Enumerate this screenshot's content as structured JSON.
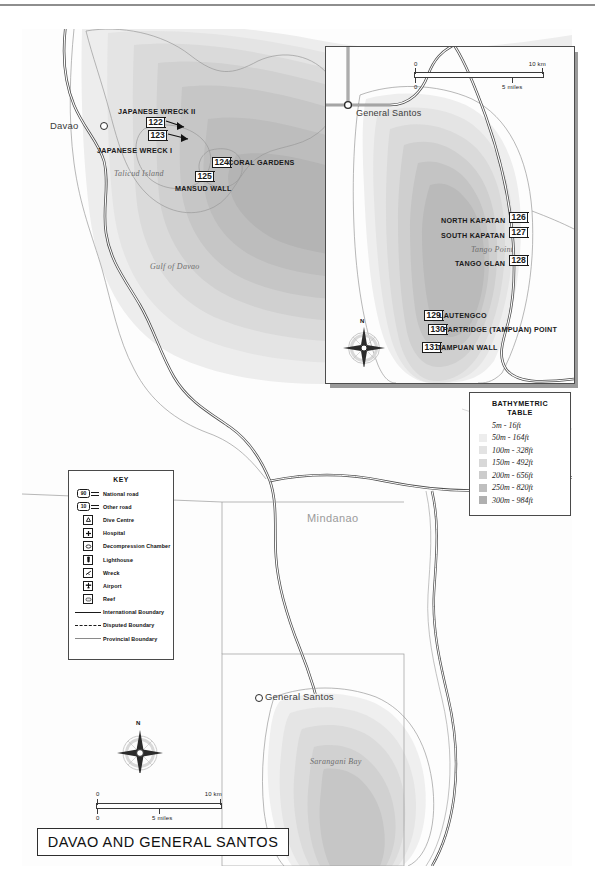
{
  "map": {
    "title": "DAVAO AND GENERAL SANTOS",
    "places": [
      {
        "name": "Davao",
        "x": 52,
        "y": 96
      },
      {
        "name": "General Santos",
        "x": 265,
        "y": 698
      }
    ],
    "water_labels": [
      {
        "name": "Gulf of Davao",
        "x": 148,
        "y": 265
      },
      {
        "name": "Sarangani Bay",
        "x": 310,
        "y": 762
      },
      {
        "name": "Talicud Island",
        "x": 114,
        "y": 173
      }
    ],
    "region_label": "Mindanao",
    "dive_sites": [
      {
        "num": "122",
        "name": "JAPANESE WRECK II",
        "name_x": 118,
        "name_y": 110,
        "mk_x": 146,
        "mk_y": 119
      },
      {
        "num": "123",
        "name": "JAPANESE WRECK I",
        "name_x": 97,
        "name_y": 149,
        "mk_x": 148,
        "mk_y": 131
      },
      {
        "num": "124",
        "name": "CORAL GARDENS",
        "name_x": 228,
        "name_y": 161,
        "mk_x": 212,
        "mk_y": 158
      },
      {
        "num": "125",
        "name": "MANSUD WALL",
        "name_x": 175,
        "name_y": 186,
        "mk_x": 195,
        "mk_y": 172
      }
    ]
  },
  "inset": {
    "place": "General Santos",
    "point_label": "Tango Point",
    "dive_sites": [
      {
        "num": "126",
        "name": "NORTH KAPATAN",
        "side": "left"
      },
      {
        "num": "127",
        "name": "SOUTH KAPATAN",
        "side": "left"
      },
      {
        "num": "128",
        "name": "TANGO GLAN",
        "side": "left"
      },
      {
        "num": "129",
        "name": "LAUTENGCO",
        "side": "right"
      },
      {
        "num": "130",
        "name": "PARTRIDGE (TAMPUAN) POINT",
        "side": "right"
      },
      {
        "num": "131",
        "name": "TAMPUAN WALL",
        "side": "right"
      }
    ],
    "scale": {
      "km_zero": "0",
      "km_max": "10 km",
      "mi_zero": "0",
      "mi_mid": "5 miles"
    },
    "compass_n": "N"
  },
  "bathymetric": {
    "title_line1": "BATHYMETRIC",
    "title_line2": "TABLE",
    "rows": [
      {
        "label": "5m - 16ft",
        "color": "#ffffff"
      },
      {
        "label": "50m - 164ft",
        "color": "#ededed"
      },
      {
        "label": "100m - 328ft",
        "color": "#e3e3e3"
      },
      {
        "label": "150m - 492ft",
        "color": "#d8d8d8"
      },
      {
        "label": "200m - 656ft",
        "color": "#cccccc"
      },
      {
        "label": "250m - 820ft",
        "color": "#bfbfbf"
      },
      {
        "label": "300m - 984ft",
        "color": "#b0b0b0"
      }
    ]
  },
  "key": {
    "title": "KEY",
    "rows": [
      {
        "label": "National road",
        "symbol": "road-shield",
        "shield": "90"
      },
      {
        "label": "Other road",
        "symbol": "road-shield",
        "shield": "10"
      },
      {
        "label": "Dive Centre",
        "symbol": "dive-centre-icon"
      },
      {
        "label": "Hospital",
        "symbol": "hospital-icon"
      },
      {
        "label": "Decompression Chamber",
        "symbol": "decompression-chamber-icon"
      },
      {
        "label": "Lighthouse",
        "symbol": "lighthouse-icon"
      },
      {
        "label": "Wreck",
        "symbol": "wreck-icon"
      },
      {
        "label": "Airport",
        "symbol": "airport-icon"
      },
      {
        "label": "Reef",
        "symbol": "reef-icon"
      },
      {
        "label": "International Boundary",
        "symbol": "solid-line"
      },
      {
        "label": "Disputed Boundary",
        "symbol": "dashed-line"
      },
      {
        "label": "Provincial Boundary",
        "symbol": "thin-line"
      }
    ]
  },
  "main_scale": {
    "km_zero": "0",
    "km_max": "10 km",
    "mi_zero": "0",
    "mi_mid": "5 miles"
  },
  "compass_n": "N",
  "colors": {
    "bathy_deepest": "#b0b0b0",
    "coast_line": "#9a9a9a",
    "road": "#4a4a4a",
    "ink": "#1a1a1a"
  }
}
